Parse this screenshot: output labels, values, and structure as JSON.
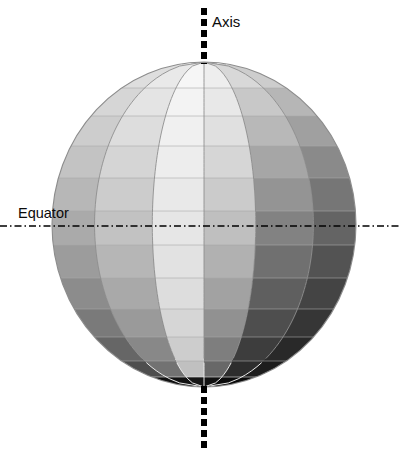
{
  "figure": {
    "type": "shaded-sphere-diagram",
    "background_color": "#ffffff",
    "width": 400,
    "height": 456
  },
  "labels": {
    "axis": "Axis",
    "equator": "Equator"
  },
  "caption": {
    "text": "",
    "visible": false
  },
  "geometry": {
    "sphere": {
      "center_x": 204,
      "center_y": 224.5,
      "radius_x": 152,
      "radius_y": 162.5,
      "outline_color": "#8c8c8c"
    },
    "axis_line": {
      "x": 204,
      "top_start_y": 8,
      "top_end_y": 62,
      "bottom_start_y": 387,
      "bottom_end_y": 449,
      "color": "#000000",
      "width": 6,
      "dash": "7 4"
    },
    "equator_line": {
      "y": 226,
      "x_start": 0,
      "x_end": 400,
      "color": "#000000",
      "width": 1.6,
      "dash": "7 3 1.5 3"
    },
    "label_positions": {
      "axis": {
        "x": 212,
        "y": 27
      },
      "equator": {
        "x": 18,
        "y": 218
      }
    }
  },
  "grid": {
    "latitude_band_count": 12,
    "meridian_column_count": 6,
    "meridian_line_color_light": "#8f8f8f",
    "meridian_line_color_dark": "#e8e8e8",
    "latitude_line_color": "#a8a8a8",
    "band_edges_y": [
      62,
      88,
      116,
      146,
      178,
      211,
      245,
      278,
      309,
      337,
      361,
      377,
      387
    ],
    "meridian_offsets": [
      -1.0,
      -0.72,
      -0.34,
      0.0,
      0.34,
      0.72,
      1.0
    ]
  },
  "chart_data": {
    "type": "heatmap",
    "xlabel": "longitude (visible meridian columns)",
    "ylabel": "latitude (bands, north to south)",
    "columns": [
      "col-1",
      "col-2",
      "col-3",
      "col-4",
      "col-5",
      "col-6"
    ],
    "rows": [
      "band-1",
      "band-2",
      "band-3",
      "band-4",
      "band-5",
      "band-6",
      "band-7",
      "band-8",
      "band-9",
      "band-10",
      "band-11",
      "band-12"
    ],
    "legend_position": "none",
    "grid": true,
    "value_scale": "grayscale luminance 0-255",
    "values": [
      [
        222,
        233,
        246,
        238,
        216,
        205
      ],
      [
        214,
        228,
        243,
        232,
        200,
        182
      ],
      [
        205,
        221,
        240,
        224,
        184,
        160
      ],
      [
        195,
        213,
        237,
        214,
        166,
        138
      ],
      [
        183,
        204,
        233,
        203,
        148,
        118
      ],
      [
        170,
        194,
        230,
        191,
        130,
        100
      ],
      [
        156,
        182,
        226,
        177,
        112,
        83
      ],
      [
        140,
        169,
        221,
        162,
        95,
        68
      ],
      [
        122,
        154,
        214,
        145,
        78,
        54
      ],
      [
        102,
        136,
        205,
        126,
        61,
        41
      ],
      [
        78,
        114,
        192,
        104,
        45,
        29
      ],
      [
        16,
        18,
        22,
        18,
        12,
        10
      ]
    ],
    "colors": [
      [
        "#dedede",
        "#e9e9e9",
        "#f6f6f6",
        "#eeeeee",
        "#d8d8d8",
        "#cdcdcd"
      ],
      [
        "#d6d6d6",
        "#e4e4e4",
        "#f3f3f3",
        "#e8e8e8",
        "#c8c8c8",
        "#b6b6b6"
      ],
      [
        "#cdcdcd",
        "#dddddd",
        "#f0f0f0",
        "#e0e0e0",
        "#b8b8b8",
        "#a0a0a0"
      ],
      [
        "#c3c3c3",
        "#d5d5d5",
        "#ededed",
        "#d6d6d6",
        "#a6a6a6",
        "#8a8a8a"
      ],
      [
        "#b7b7b7",
        "#cccccc",
        "#e9e9e9",
        "#cbcbcb",
        "#949494",
        "#767676"
      ],
      [
        "#aaaaaa",
        "#c2c2c2",
        "#e6e6e6",
        "#bfbfbf",
        "#828282",
        "#646464"
      ],
      [
        "#9c9c9c",
        "#b6b6b6",
        "#e2e2e2",
        "#b1b1b1",
        "#707070",
        "#535353"
      ],
      [
        "#8c8c8c",
        "#a9a9a9",
        "#dddddd",
        "#a2a2a2",
        "#5f5f5f",
        "#444444"
      ],
      [
        "#7a7a7a",
        "#9a9a9a",
        "#d6d6d6",
        "#919191",
        "#4e4e4e",
        "#363636"
      ],
      [
        "#666666",
        "#888888",
        "#cdcdcd",
        "#7e7e7e",
        "#3d3d3d",
        "#292929"
      ],
      [
        "#4e4e4e",
        "#727272",
        "#c0c0c0",
        "#686868",
        "#2d2d2d",
        "#1d1d1d"
      ],
      [
        "#101010",
        "#121212",
        "#161616",
        "#121212",
        "#0c0c0c",
        "#0a0a0a"
      ]
    ]
  }
}
